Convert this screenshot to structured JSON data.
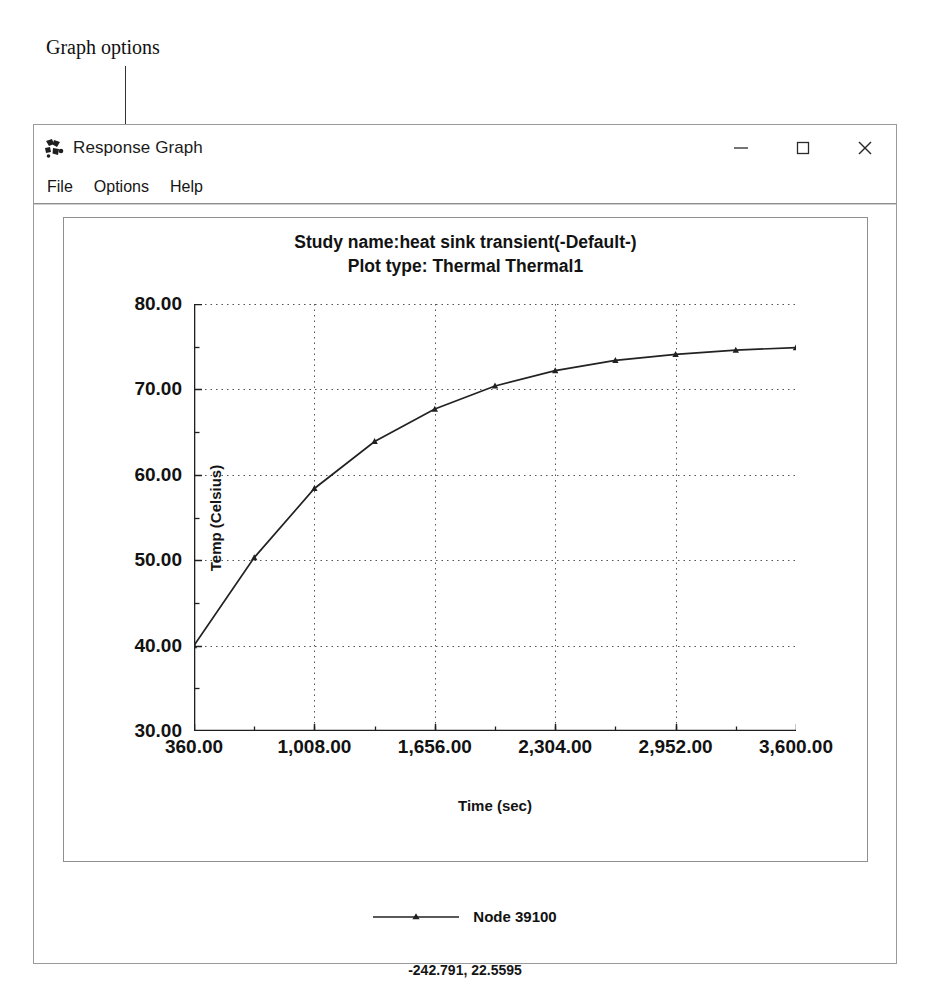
{
  "annotation": {
    "label": "Graph options"
  },
  "window": {
    "title": "Response Graph",
    "icon": "response-graph-icon",
    "controls": {
      "minimize": "minimize-icon",
      "maximize": "maximize-icon",
      "close": "close-icon"
    }
  },
  "menu": {
    "items": [
      {
        "label": "File"
      },
      {
        "label": "Options"
      },
      {
        "label": "Help"
      }
    ]
  },
  "legend": {
    "series_label": "Node 39100"
  },
  "status": {
    "readout": "-242.791, 22.5595"
  },
  "chart_data": {
    "type": "line",
    "title": "Study name:heat sink transient(-Default-)",
    "subtitle": "Plot type: Thermal Thermal1",
    "title_lines": [
      "Study name:heat sink transient(-Default-)",
      "Plot type: Thermal Thermal1"
    ],
    "xlabel": "Time (sec)",
    "ylabel": "Temp (Celsius)",
    "xlim": [
      360,
      3600
    ],
    "ylim": [
      30,
      80
    ],
    "xticks": [
      360,
      1008,
      1656,
      2304,
      2952,
      3600
    ],
    "xticklabels": [
      "360.00",
      "1,008.00",
      "1,656.00",
      "2,304.00",
      "2,952.00",
      "3,600.00"
    ],
    "yticks": [
      30,
      40,
      50,
      60,
      70,
      80
    ],
    "yticklabels": [
      "30.00",
      "40.00",
      "50.00",
      "60.00",
      "70.00",
      "80.00"
    ],
    "x_minor_step": 324,
    "y_minor_step": 5,
    "grid": true,
    "grid_style": "dotted",
    "legend_position": "below-plot",
    "line_color": "#222222",
    "marker": "triangle",
    "series": [
      {
        "name": "Node 39100",
        "x": [
          360,
          684,
          1008,
          1332,
          1656,
          1980,
          2304,
          2628,
          2952,
          3276,
          3600
        ],
        "y": [
          40.0,
          50.3,
          58.4,
          63.9,
          67.7,
          70.4,
          72.2,
          73.4,
          74.1,
          74.6,
          74.9
        ]
      }
    ]
  }
}
